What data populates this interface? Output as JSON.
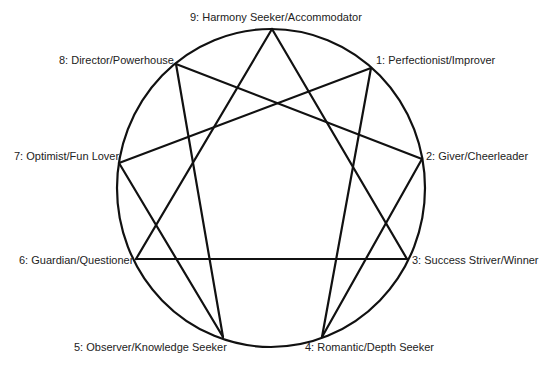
{
  "diagram": {
    "type": "enneagram",
    "stroke_color": "#111111",
    "background_color": "#ffffff",
    "circle": {
      "cx": 271,
      "cy": 188,
      "rx": 154,
      "ry": 159
    },
    "points": [
      {
        "id": "9",
        "label": "9: Harmony Seeker/Accommodator",
        "x": 272,
        "y": 29
      },
      {
        "id": "1",
        "label": "1: Perfectionist/Improver",
        "x": 371,
        "y": 68
      },
      {
        "id": "2",
        "label": "2: Giver/Cheerleader",
        "x": 422,
        "y": 159
      },
      {
        "id": "3",
        "label": "3: Success Striver/Winner",
        "x": 407,
        "y": 259
      },
      {
        "id": "4",
        "label": "4: Romantic/Depth Seeker",
        "x": 322,
        "y": 337
      },
      {
        "id": "5",
        "label": "5: Observer/Knowledge Seeker",
        "x": 223,
        "y": 337
      },
      {
        "id": "6",
        "label": "6: Guardian/Questioner",
        "x": 136,
        "y": 259
      },
      {
        "id": "7",
        "label": "7: Optimist/Fun Lover",
        "x": 119,
        "y": 163
      },
      {
        "id": "8",
        "label": "8: Director/Powerhouse",
        "x": 176,
        "y": 64
      }
    ],
    "connections": [
      [
        "9",
        "3"
      ],
      [
        "3",
        "6"
      ],
      [
        "6",
        "9"
      ],
      [
        "1",
        "4"
      ],
      [
        "4",
        "2"
      ],
      [
        "2",
        "8"
      ],
      [
        "8",
        "5"
      ],
      [
        "5",
        "7"
      ],
      [
        "7",
        "1"
      ]
    ]
  },
  "labels": {
    "p9": "9: Harmony Seeker/Accommodator",
    "p1": "1: Perfectionist/Improver",
    "p2": "2: Giver/Cheerleader",
    "p3": "3: Success Striver/Winner",
    "p4": "4: Romantic/Depth Seeker",
    "p5": "5: Observer/Knowledge Seeker",
    "p6": "6: Guardian/Questioner",
    "p7": "7: Optimist/Fun Lover",
    "p8": "8: Director/Powerhouse"
  }
}
